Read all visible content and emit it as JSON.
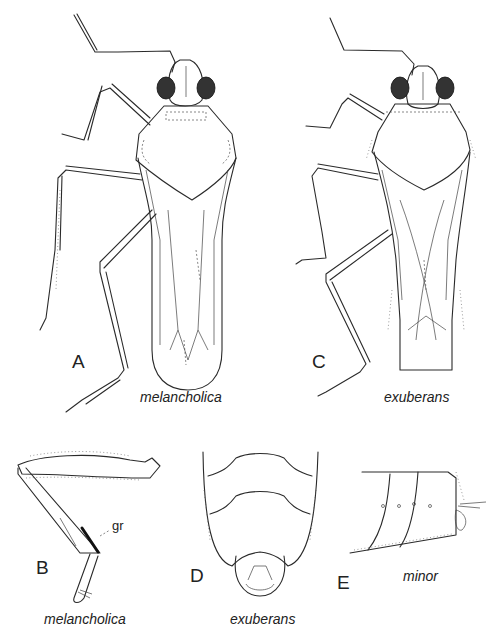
{
  "figure": {
    "panels": [
      {
        "letter": "A",
        "species": "melancholica",
        "view": "dorsal habitus"
      },
      {
        "letter": "B",
        "species": "melancholica",
        "view": "hind leg",
        "annotation": "gr"
      },
      {
        "letter": "C",
        "species": "exuberans",
        "view": "dorsal habitus"
      },
      {
        "letter": "D",
        "species": "exuberans",
        "view": "abdomen apex ventral"
      },
      {
        "letter": "E",
        "species": "minor",
        "view": "abdomen apex lateral"
      }
    ]
  },
  "colors": {
    "background": "#ffffff",
    "ink": "#2a2a2a",
    "eye": "#333333"
  }
}
